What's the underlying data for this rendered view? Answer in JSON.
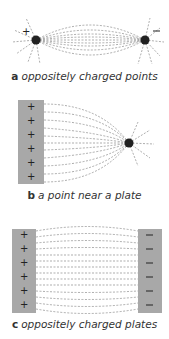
{
  "panels": [
    {
      "letter": "a",
      "caption": "oppositely charged points",
      "left_sign": "+",
      "right_sign": "−"
    },
    {
      "letter": "b",
      "caption": "a point near a plate",
      "plate_sign": "+",
      "point_sign": "−"
    },
    {
      "letter": "c",
      "caption": "oppositely charged plates",
      "left_sign": "+",
      "right_sign": "−"
    }
  ],
  "colors": {
    "plate": "#a8a8a8",
    "charge": "#222222",
    "field_line": "#777777",
    "text": "#333333"
  }
}
